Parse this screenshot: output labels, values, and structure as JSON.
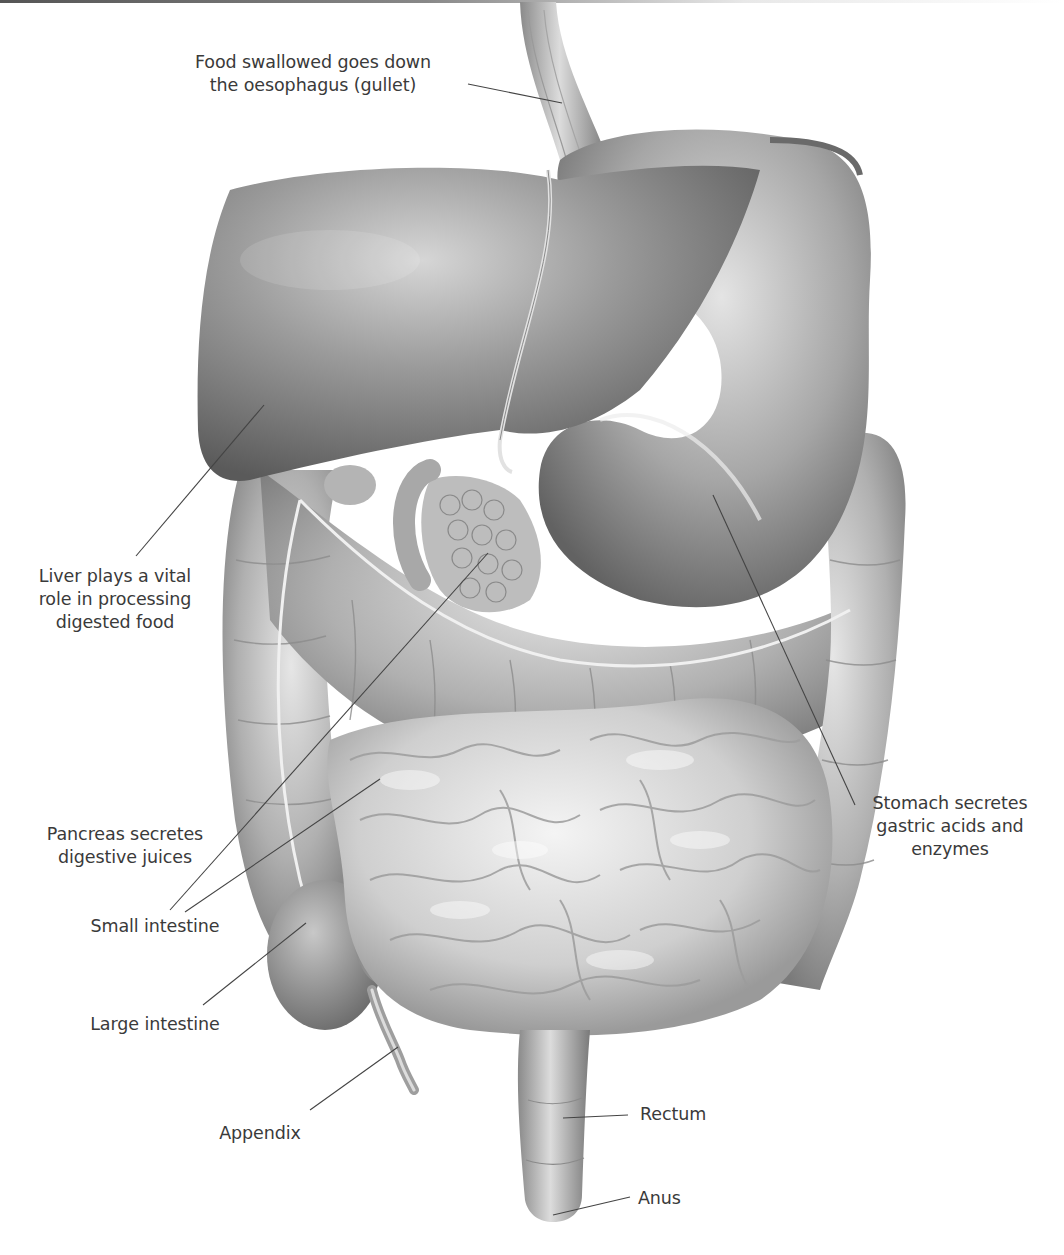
{
  "diagram": {
    "colors": {
      "background": "#ffffff",
      "organ_base": "#9a9a9a",
      "organ_light": "#d8d8d8",
      "organ_dark": "#5e5e5e",
      "leader_line": "#444444",
      "text": "#3a3a3a"
    },
    "labels": [
      {
        "id": "oesophagus",
        "lines": [
          "Food swallowed goes down",
          "the oesophagus (gullet)"
        ],
        "x": 312,
        "y": 51,
        "align": "center",
        "leader": {
          "x1": 468,
          "y1": 84,
          "x2": 562,
          "y2": 103
        }
      },
      {
        "id": "liver",
        "lines": [
          "Liver plays a vital",
          "role in processing",
          "digested food"
        ],
        "x": 103,
        "y": 565,
        "align": "center",
        "leader": {
          "x1": 136,
          "y1": 556,
          "x2": 264,
          "y2": 405
        }
      },
      {
        "id": "pancreas",
        "lines": [
          "Pancreas secretes",
          "digestive juices"
        ],
        "x": 116,
        "y": 823,
        "align": "center",
        "leader": {
          "x1": 170,
          "y1": 910,
          "x2": 488,
          "y2": 553
        }
      },
      {
        "id": "small-intestine",
        "lines": [
          "Small intestine"
        ],
        "x": 88,
        "y": 915,
        "align": "center",
        "leader": {
          "x1": 185,
          "y1": 912,
          "x2": 380,
          "y2": 779
        }
      },
      {
        "id": "large-intestine",
        "lines": [
          "Large intestine"
        ],
        "x": 76,
        "y": 1013,
        "align": "center",
        "leader": {
          "x1": 203,
          "y1": 1005,
          "x2": 306,
          "y2": 923
        }
      },
      {
        "id": "appendix",
        "lines": [
          "Appendix"
        ],
        "x": 260,
        "y": 1120,
        "align": "center",
        "leader": {
          "x1": 310,
          "y1": 1110,
          "x2": 398,
          "y2": 1047
        }
      },
      {
        "id": "stomach",
        "lines": [
          "Stomach secretes",
          "gastric acids and",
          "enzymes"
        ],
        "x": 870,
        "y": 792,
        "align": "center",
        "leader": {
          "x1": 855,
          "y1": 805,
          "x2": 713,
          "y2": 495
        }
      },
      {
        "id": "rectum",
        "lines": [
          "Rectum"
        ],
        "x": 640,
        "y": 1140,
        "align": "left",
        "leader": {
          "x1": 628,
          "y1": 1115,
          "x2": 563,
          "y2": 1118
        }
      },
      {
        "id": "anus",
        "lines": [
          "Anus"
        ],
        "x": 638,
        "y": 1187,
        "align": "left",
        "leader": {
          "x1": 630,
          "y1": 1197,
          "x2": 553,
          "y2": 1215
        }
      }
    ]
  }
}
